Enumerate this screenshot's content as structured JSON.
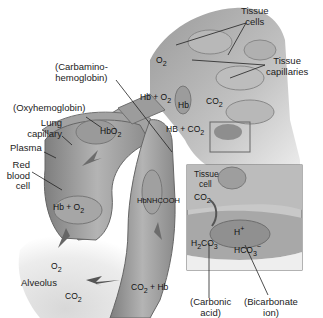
{
  "diagram": {
    "labels": {
      "tissue_cells": [
        "Tissue",
        "cells"
      ],
      "tissue_capillaries": [
        "Tissue",
        "capillaries"
      ],
      "carbamino": [
        "(Carbamino-",
        "hemoglobin)"
      ],
      "oxyhemoglobin": "(Oxyhemoglobin)",
      "lung_capillary": [
        "Lung",
        "capillary"
      ],
      "plasma": "Plasma",
      "red_blood_cell": [
        "Red",
        "blood",
        "cell"
      ],
      "alveolus": "Alveolus",
      "inset_tissue_cell": [
        "Tissue",
        "cell"
      ],
      "carbonic_acid": [
        "(Carbonic",
        "acid)"
      ],
      "bicarbonate_ion": [
        "(Bicarbonate",
        "ion)"
      ]
    },
    "chemistry": {
      "o2_top": "O",
      "o2_top_sub": "2",
      "hb_plus_o2_top": "Hb + O",
      "hb_plus_o2_top_sub": "2",
      "hb_tissue": "Hb",
      "co2_tissue": "CO",
      "co2_tissue_sub": "2",
      "hb_plus_co2": "HB + CO",
      "hb_plus_co2_sub": "2",
      "hbo2": "HbO",
      "hbo2_sub": "2",
      "hb_plus_o2_rbc": "Hb + O",
      "hb_plus_o2_rbc_sub": "2",
      "hbnhcooh": "HbNHCOOH",
      "o2_alveolus": "O",
      "o2_alveolus_sub": "2",
      "co2_alveolus": "CO",
      "co2_alveolus_sub": "2",
      "co2_plus_hb": "CO",
      "co2_plus_hb_sub": "2",
      "co2_plus_hb_rest": "+ Hb",
      "inset_co2": "CO",
      "inset_co2_sub": "2",
      "h_plus": "H",
      "h_plus_sup": "+",
      "h2co3_a": "H",
      "h2co3_sub1": "2",
      "h2co3_b": "CO",
      "h2co3_sub2": "3",
      "hco3": "HCO",
      "hco3_sub": "3",
      "hco3_sup": "−"
    },
    "colors": {
      "background": "#ffffff",
      "vessel_dark": "#8a8a8a",
      "vessel_mid": "#a8a8a8",
      "vessel_light": "#cfcfcf",
      "alveolus": "#e4e4e4",
      "inset_border": "#666666",
      "text": "#222222"
    }
  }
}
